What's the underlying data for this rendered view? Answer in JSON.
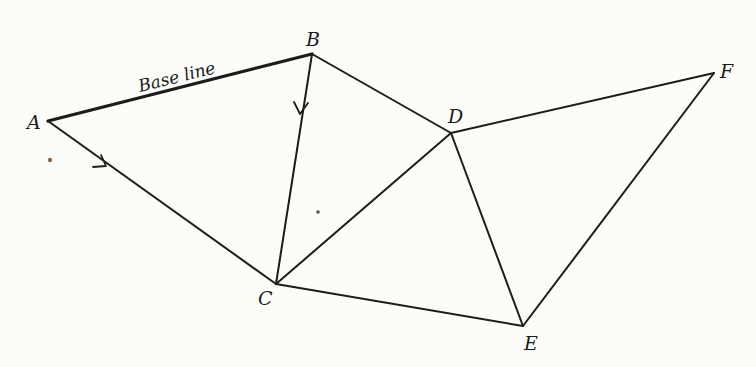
{
  "diagram": {
    "base_line_label": "Base line",
    "vertices": [
      {
        "id": "A",
        "label": "A",
        "x": 48,
        "y": 121
      },
      {
        "id": "B",
        "label": "B",
        "x": 312,
        "y": 54
      },
      {
        "id": "C",
        "label": "C",
        "x": 276,
        "y": 284
      },
      {
        "id": "D",
        "label": "D",
        "x": 451,
        "y": 133
      },
      {
        "id": "E",
        "label": "E",
        "x": 523,
        "y": 326
      },
      {
        "id": "F",
        "label": "F",
        "x": 714,
        "y": 73
      }
    ],
    "edges": [
      {
        "from": "A",
        "to": "B",
        "base_line": true
      },
      {
        "from": "A",
        "to": "C",
        "arrow": true
      },
      {
        "from": "B",
        "to": "C",
        "arrow": true
      },
      {
        "from": "B",
        "to": "D"
      },
      {
        "from": "C",
        "to": "D"
      },
      {
        "from": "C",
        "to": "E"
      },
      {
        "from": "D",
        "to": "E"
      },
      {
        "from": "D",
        "to": "F"
      },
      {
        "from": "E",
        "to": "F"
      }
    ]
  }
}
